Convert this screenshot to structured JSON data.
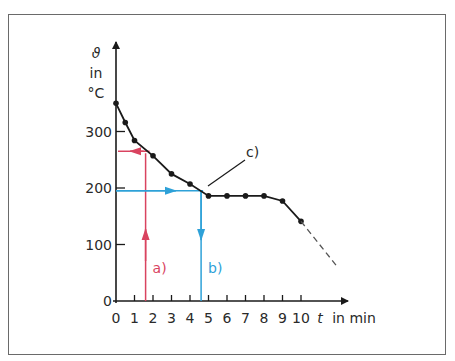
{
  "chart_data": {
    "type": "line",
    "title": "",
    "xlabel": "t in min",
    "ylabel": "ϑ in °C",
    "xlim": [
      0,
      12
    ],
    "ylim": [
      0,
      400
    ],
    "x_ticks": [
      "0",
      "1",
      "2",
      "3",
      "4",
      "5",
      "6",
      "7",
      "8",
      "9",
      "10"
    ],
    "y_ticks": [
      "0",
      "100",
      "200",
      "300"
    ],
    "grid": false,
    "legend": null,
    "series": [
      {
        "name": "cooling curve",
        "color": "#1a1a1a",
        "x": [
          0,
          0.5,
          1,
          2,
          3,
          4,
          5,
          6,
          7,
          8,
          9,
          10
        ],
        "y": [
          350,
          316,
          284,
          257,
          225,
          207,
          186,
          186,
          186,
          186,
          177,
          141
        ]
      },
      {
        "name": "extrapolation (dashed)",
        "color": "#555555",
        "x": [
          10,
          12
        ],
        "y": [
          141,
          59
        ]
      }
    ],
    "annotations": [
      {
        "label": "a)",
        "color": "#d9435f",
        "x": 1.6,
        "y_read": 265,
        "description": "vertical arrow up at t≈1.6 min to curve, horizontal arrow left to y-axis at ≈265 °C"
      },
      {
        "label": "b)",
        "color": "#2ea1d8",
        "x": 4.6,
        "y_read": 195,
        "description": "horizontal arrow right from y-axis at ≈195 °C to curve, vertical arrow down to t≈4.6 min"
      },
      {
        "label": "c)",
        "color": "#1a1a1a",
        "x": 5,
        "y": 186,
        "description": "leader line pointing to start of plateau (freezing point)"
      }
    ]
  },
  "labels": {
    "y_symbol": "ϑ",
    "y_in": "in",
    "y_unit": "°C",
    "x_symbol": "t",
    "x_unit": "in min",
    "annotation_a": "a)",
    "annotation_b": "b)",
    "annotation_c": "c)"
  },
  "colors": {
    "red": "#d9435f",
    "blue": "#2ea1d8",
    "ink": "#1a1a1a"
  }
}
